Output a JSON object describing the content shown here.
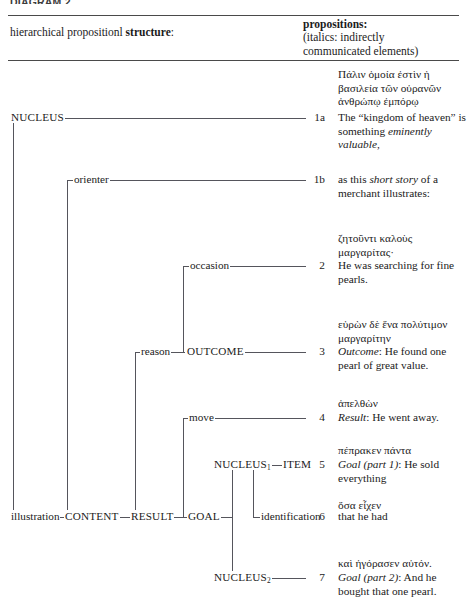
{
  "figure": {
    "top_caption": "DIAGRAM 2",
    "header": {
      "left_plain": "hierarchical propositionl ",
      "left_bold": "structure",
      "left_colon": ":",
      "right_title": "propositions:",
      "right_note_line1": "(italics: indirectly",
      "right_note_line2": "communicated elements)"
    },
    "line_color": "#55555c",
    "rule_color": "#4a4a4a"
  },
  "tree": {
    "nodes": [
      {
        "id": "nucleus",
        "label": "NUCLEUS"
      },
      {
        "id": "orienter",
        "label": "orienter"
      },
      {
        "id": "occasion",
        "label": "occasion"
      },
      {
        "id": "reason",
        "label": "reason"
      },
      {
        "id": "outcome",
        "label": "OUTCOME"
      },
      {
        "id": "move",
        "label": "move"
      },
      {
        "id": "nucleus1",
        "label": "NUCLEUS",
        "sub": "1"
      },
      {
        "id": "item",
        "label": "ITEM"
      },
      {
        "id": "identification",
        "label": "identification"
      },
      {
        "id": "illustration",
        "label": "illustration"
      },
      {
        "id": "content",
        "label": "CONTENT"
      },
      {
        "id": "result",
        "label": "RESULT"
      },
      {
        "id": "goal",
        "label": "GOAL"
      },
      {
        "id": "nucleus2",
        "label": "NUCLEUS",
        "sub": "2"
      }
    ]
  },
  "rows": [
    {
      "num": "1a",
      "greek": "Πάλιν ὁμοία ἐστὶν ἡ βασιλεία τῶν οὐρανῶν ἀνθρώπῳ ἐμπόρῳ",
      "english_pre": "The “kingdom of heaven” is something ",
      "english_italic": "eminently valuable,",
      "english_post": ""
    },
    {
      "num": "1b",
      "greek": "",
      "english_pre": "as this ",
      "english_italic": "short story",
      "english_post": " of a merchant illustrates:"
    },
    {
      "num": "2",
      "greek": "ζητοῦντι καλοὺς μαργαρίτας·",
      "english_pre": "He was searching for fine pearls.",
      "english_italic": "",
      "english_post": ""
    },
    {
      "num": "3",
      "greek": "εὑρὼν δὲ ἕνα πολύτιμον μαργαρίτην",
      "english_pre": "",
      "english_italic": "Outcome",
      "english_post": ": He found one pearl of great value."
    },
    {
      "num": "4",
      "greek": "ἀπελθὼν",
      "english_pre": "",
      "english_italic": "Result",
      "english_post": ": He went away."
    },
    {
      "num": "5",
      "greek": "πέπρακεν πάντα",
      "english_pre": "",
      "english_italic": "Goal (part 1)",
      "english_post": ": He sold everything"
    },
    {
      "num": "6",
      "greek": "ὅσα εἶχεν",
      "english_pre": "that he had",
      "english_italic": "",
      "english_post": ""
    },
    {
      "num": "7",
      "greek": "καὶ ἠγόρασεν αὐτόν.",
      "english_pre": "",
      "english_italic": "Goal (part 2)",
      "english_post": ": And he bought that one pearl."
    }
  ]
}
